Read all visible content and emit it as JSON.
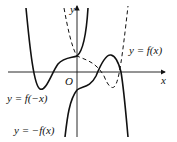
{
  "diagram": {
    "axes": {
      "x_label": "x",
      "y_label": "y",
      "origin_label": "O"
    },
    "curves": [
      {
        "label": "y = f(x)",
        "style": "dashed"
      },
      {
        "label": "y = f(−x)",
        "style": "solid"
      },
      {
        "label": "y = −f(x)",
        "style": "solid"
      }
    ]
  }
}
